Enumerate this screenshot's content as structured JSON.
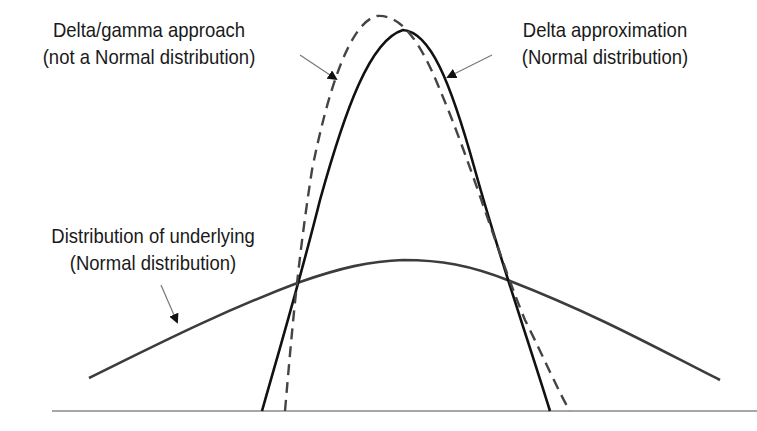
{
  "diagram": {
    "title": "",
    "labels": {
      "delta_gamma": {
        "line1": "Delta/gamma approach",
        "line2": "(not a Normal distribution)"
      },
      "delta": {
        "line1": "Delta approximation",
        "line2": "(Normal distribution)"
      },
      "underlying": {
        "line1": "Distribution of underlying",
        "line2": "(Normal distribution)"
      }
    },
    "curves": [
      {
        "name": "Delta/gamma approach",
        "style": "dashed",
        "color": "#444444",
        "shape": "skewed bell, peak slightly left of center, tallest"
      },
      {
        "name": "Delta approximation",
        "style": "solid",
        "color": "#111111",
        "shape": "narrow Normal bell"
      },
      {
        "name": "Distribution of underlying",
        "style": "solid",
        "color": "#3a3a3a",
        "shape": "wide flat Normal bell"
      }
    ],
    "colors": {
      "background": "#ffffff",
      "axis": "#888888",
      "text": "#1a1a1a"
    }
  }
}
